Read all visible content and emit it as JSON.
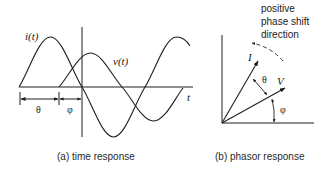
{
  "panel_a": {
    "caption": "(a) time response",
    "current_label": "i(t)",
    "voltage_label": "v(t)",
    "time_axis_label": "t",
    "theta_label": "θ",
    "phi_label": "φ"
  },
  "panel_b": {
    "caption": "(b) phasor response",
    "current_phasor_label": "I",
    "voltage_phasor_label": "V",
    "theta_label": "θ",
    "phi_label": "φ",
    "direction_note": {
      "line1": "positive",
      "line2": "phase shift",
      "line3": "direction"
    }
  },
  "colors": {
    "stroke": "#1f1f1f",
    "background": "#ffffff"
  }
}
